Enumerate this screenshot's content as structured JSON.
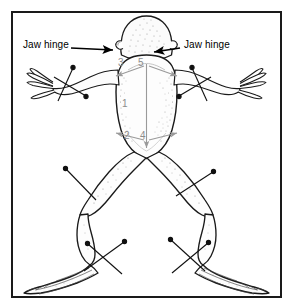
{
  "figure": {
    "view": "ventral",
    "border_color": "#1a1a1a",
    "background_color": "#ffffff",
    "ink_color": "#000000",
    "number_color": "#8c8c8c",
    "width": 293,
    "height": 308
  },
  "labels": [
    {
      "id": "jaw-hinge-left",
      "text": "Jaw hinge",
      "side": "left",
      "arrow": "points-right-to-left-jaw-hinge"
    },
    {
      "id": "jaw-hinge-right",
      "text": "Jaw hinge",
      "side": "right",
      "arrow": "points-left-to-right-jaw-hinge"
    }
  ],
  "incision_numbers": [
    {
      "id": "num-1",
      "text": "1",
      "meaning": "midline ventral cut"
    },
    {
      "id": "num-2",
      "text": "2",
      "meaning": "lower left lateral cut"
    },
    {
      "id": "num-3",
      "text": "3",
      "meaning": "upper left lateral cut"
    },
    {
      "id": "num-4",
      "text": "4",
      "meaning": "lower right lateral cut"
    },
    {
      "id": "num-5",
      "text": "5",
      "meaning": "upper right lateral cut"
    }
  ],
  "pins": {
    "count": 8,
    "arrangement": "crossed-pairs",
    "locations": [
      "left-forelimb-hand",
      "right-forelimb-hand",
      "left-hindlimb-thigh",
      "right-hindlimb-thigh",
      "left-hindlimb-ankle",
      "right-hindlimb-ankle"
    ]
  }
}
